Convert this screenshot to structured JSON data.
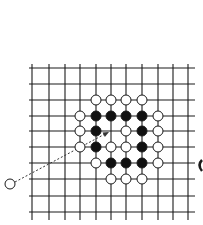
{
  "diagram": {
    "type": "go-board-fragment",
    "grid": {
      "columns_x": [
        32,
        49,
        65,
        80,
        96,
        111,
        126,
        142,
        158,
        173,
        188
      ],
      "rows_y": [
        68,
        84,
        100,
        116,
        131,
        147,
        163,
        179,
        196,
        212
      ],
      "h_line_x_start": 29,
      "h_line_x_end": 195,
      "v_line_y_start": 64,
      "v_line_y_end": 220,
      "line_color": "#1a1a1a"
    },
    "stone_radius": 5,
    "stones": [
      {
        "color": "white",
        "col": 4,
        "row": 2
      },
      {
        "color": "white",
        "col": 5,
        "row": 2
      },
      {
        "color": "white",
        "col": 6,
        "row": 2
      },
      {
        "color": "white",
        "col": 7,
        "row": 2
      },
      {
        "color": "white",
        "col": 3,
        "row": 3
      },
      {
        "color": "black",
        "col": 4,
        "row": 3
      },
      {
        "color": "black",
        "col": 5,
        "row": 3
      },
      {
        "color": "black",
        "col": 6,
        "row": 3
      },
      {
        "color": "black",
        "col": 7,
        "row": 3
      },
      {
        "color": "white",
        "col": 8,
        "row": 3
      },
      {
        "color": "white",
        "col": 3,
        "row": 4
      },
      {
        "color": "black",
        "col": 4,
        "row": 4
      },
      {
        "color": "white",
        "col": 6,
        "row": 4
      },
      {
        "color": "black",
        "col": 7,
        "row": 4
      },
      {
        "color": "white",
        "col": 8,
        "row": 4
      },
      {
        "color": "white",
        "col": 3,
        "row": 5
      },
      {
        "color": "black",
        "col": 4,
        "row": 5
      },
      {
        "color": "white",
        "col": 5,
        "row": 5
      },
      {
        "color": "white",
        "col": 6,
        "row": 5
      },
      {
        "color": "black",
        "col": 7,
        "row": 5
      },
      {
        "color": "white",
        "col": 8,
        "row": 5
      },
      {
        "color": "white",
        "col": 4,
        "row": 6
      },
      {
        "color": "black",
        "col": 5,
        "row": 6
      },
      {
        "color": "black",
        "col": 6,
        "row": 6
      },
      {
        "color": "black",
        "col": 7,
        "row": 6
      },
      {
        "color": "white",
        "col": 8,
        "row": 6
      },
      {
        "color": "white",
        "col": 5,
        "row": 7
      },
      {
        "color": "white",
        "col": 6,
        "row": 7
      },
      {
        "color": "white",
        "col": 7,
        "row": 7
      }
    ],
    "outside_stone": {
      "color": "white",
      "x": 10,
      "y": 184
    },
    "move_arrow": {
      "from": [
        15,
        182
      ],
      "to": [
        109,
        132
      ],
      "style": "dotted",
      "target": {
        "col": 5,
        "row": 4
      }
    },
    "colors": {
      "black_stone": "#111111",
      "white_stone_fill": "#ffffff",
      "stone_stroke": "#1a1a1a"
    }
  }
}
